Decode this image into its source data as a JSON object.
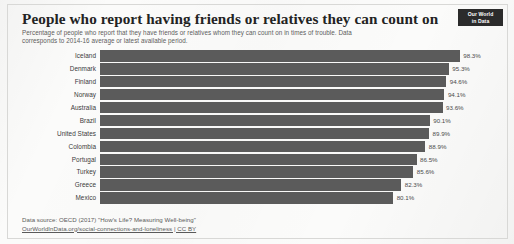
{
  "header": {
    "title": "People who report having friends or relatives they can count on",
    "subtitle": "Percentage of people who report that they have friends or relatives whom they can count on in times of trouble. Data corresponds to 2014-16 average or latest available period.",
    "logo_line1": "Our World",
    "logo_line2": "in Data"
  },
  "footer": {
    "source": "Data source: OECD (2017) \"How's Life? Measuring Well-being\"",
    "link": "OurWorldInData.org/social-connections-and-loneliness | CC BY"
  },
  "colors": {
    "bar": "#5b5b5b",
    "text": "#3a3a3a",
    "logo_bg": "#2b2b2b",
    "frame": "#d8d8d6",
    "page_bg": "#fbfbfa"
  },
  "chart_data": {
    "type": "bar",
    "orientation": "horizontal",
    "title": "People who report having friends or relatives they can count on",
    "subtitle": "Percentage of people who report that they have friends or relatives whom they can count on in times of trouble. Data corresponds to 2014-16 average or latest available period.",
    "xlabel": "",
    "ylabel": "",
    "xlim": [
      0,
      100
    ],
    "unit": "%",
    "grid": false,
    "legend": "none",
    "value_labels": true,
    "categories": [
      "Iceland",
      "Denmark",
      "Finland",
      "Norway",
      "Australia",
      "Brazil",
      "United States",
      "Colombia",
      "Portugal",
      "Turkey",
      "Greece",
      "Mexico"
    ],
    "values": [
      98.3,
      95.3,
      94.6,
      94.1,
      93.6,
      90.1,
      89.9,
      88.9,
      86.5,
      85.6,
      82.3,
      80.1
    ],
    "value_label_texts": [
      "98.3%",
      "95.3%",
      "94.6%",
      "94.1%",
      "93.6%",
      "90.1%",
      "89.9%",
      "88.9%",
      "86.5%",
      "85.6%",
      "82.3%",
      "80.1%"
    ],
    "bars": [
      {
        "label": "Iceland",
        "value": 98.3,
        "value_text": "98.3%"
      },
      {
        "label": "Denmark",
        "value": 95.3,
        "value_text": "95.3%"
      },
      {
        "label": "Finland",
        "value": 94.6,
        "value_text": "94.6%"
      },
      {
        "label": "Norway",
        "value": 94.1,
        "value_text": "94.1%"
      },
      {
        "label": "Australia",
        "value": 93.6,
        "value_text": "93.6%"
      },
      {
        "label": "Brazil",
        "value": 90.1,
        "value_text": "90.1%"
      },
      {
        "label": "United States",
        "value": 89.9,
        "value_text": "89.9%"
      },
      {
        "label": "Colombia",
        "value": 88.9,
        "value_text": "88.9%"
      },
      {
        "label": "Portugal",
        "value": 86.5,
        "value_text": "86.5%"
      },
      {
        "label": "Turkey",
        "value": 85.6,
        "value_text": "85.6%"
      },
      {
        "label": "Greece",
        "value": 82.3,
        "value_text": "82.3%"
      },
      {
        "label": "Mexico",
        "value": 80.1,
        "value_text": "80.1%"
      }
    ]
  }
}
